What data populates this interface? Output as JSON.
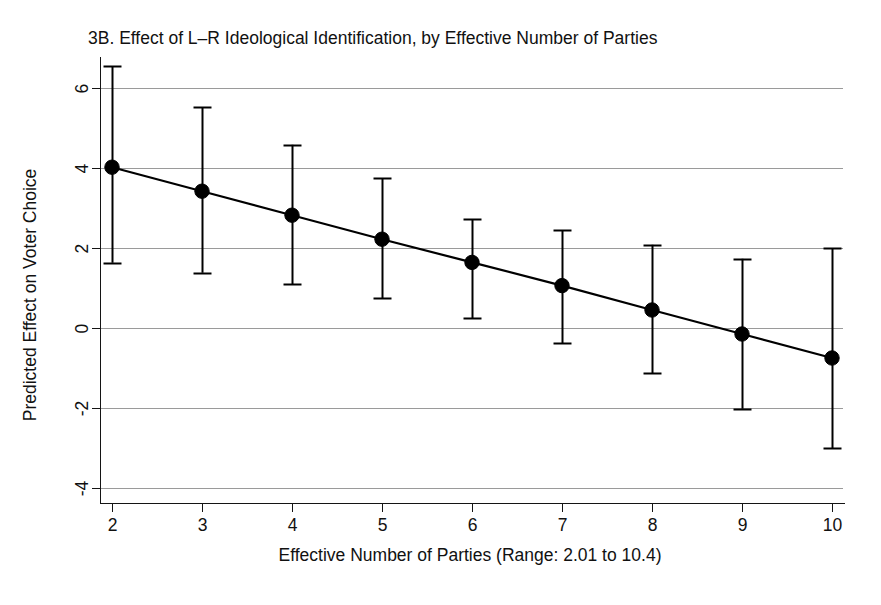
{
  "chart_data": {
    "type": "line",
    "title": "3B. Effect of L–R Ideological Identification, by Effective Number of Parties",
    "xlabel": "Effective Number of Parties (Range: 2.01 to 10.4)",
    "ylabel": "Predicted Effect on Voter Choice",
    "x": [
      2,
      3,
      4,
      5,
      6,
      7,
      8,
      9,
      10
    ],
    "values": [
      4.02,
      3.42,
      2.82,
      2.22,
      1.64,
      1.06,
      0.45,
      -0.15,
      -0.75
    ],
    "ci_lower": [
      1.63,
      1.38,
      1.1,
      0.75,
      0.25,
      -0.38,
      -1.13,
      -2.02,
      -3.0
    ],
    "ci_upper": [
      6.55,
      5.52,
      4.58,
      3.75,
      2.72,
      2.45,
      2.08,
      1.73,
      2.0
    ],
    "xticks": [
      2,
      3,
      4,
      5,
      6,
      7,
      8,
      9,
      10
    ],
    "xtick_labels": [
      "2",
      "3",
      "4",
      "5",
      "6",
      "7",
      "8",
      "9",
      "10"
    ],
    "yticks": [
      -4,
      -2,
      0,
      2,
      4,
      6
    ],
    "ytick_labels": [
      "-4",
      "-2",
      "0",
      "2",
      "4",
      "6"
    ],
    "xlim": [
      1.87,
      10.35
    ],
    "ylim": [
      -4.45,
      6.75
    ],
    "grid": true,
    "grid_axis": "y",
    "legend": false,
    "marker": "filled-circle",
    "error_bar_style": "capped-vertical",
    "colors": {
      "line": "#000000",
      "marker": "#000000",
      "error_bar": "#000000",
      "gridline": "#9a9a9a",
      "axis": "#141414",
      "background": "#ffffff",
      "text": "#111111"
    }
  },
  "labels": {
    "title": "3B. Effect of L–R Ideological Identification, by Effective Number of Parties",
    "y_axis_title": "Predicted Effect on Voter Choice",
    "x_axis_title": "Effective Number of Parties (Range: 2.01 to 10.4)"
  }
}
